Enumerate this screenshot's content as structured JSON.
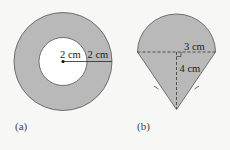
{
  "colors": {
    "background": "#f7f7f5",
    "shape_fill": "#b9b9b9",
    "stroke": "#555555",
    "inner_fill": "#ffffff"
  },
  "figure_a": {
    "caption": "(a)",
    "inner_radius_label": "2 cm",
    "ring_width_label": "2 cm",
    "description": "Annulus: inner circle radius 2 cm, ring width 2 cm"
  },
  "figure_b": {
    "caption": "(b)",
    "radius_label": "3 cm",
    "height_label": "4 cm",
    "description": "Semicircle of radius 3 cm atop an isosceles triangle of height 4 cm"
  }
}
